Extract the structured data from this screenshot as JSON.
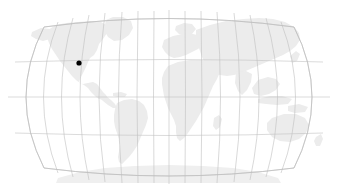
{
  "map": {
    "title": "World Map",
    "projection": "robinson",
    "background_color": "#ffffff",
    "land_color": "#ececec",
    "graticule_color": "#bfbfbf",
    "outline_color": "#bdbdbd",
    "marker_color": "#000000",
    "viewport": {
      "width": 337,
      "height": 196
    },
    "graticule": {
      "visible": true,
      "meridian_interval_degrees": 20,
      "parallel_interval_degrees": 30,
      "central_meridian_longitude": 0,
      "parallels_degrees": [
        60,
        30,
        0,
        -30,
        -60
      ],
      "meridians_degrees": [
        -180,
        -160,
        -140,
        -120,
        -100,
        -80,
        -60,
        -40,
        -20,
        0,
        20,
        40,
        60,
        80,
        100,
        120,
        140,
        160,
        180
      ]
    },
    "extent": {
      "left_px": 8,
      "right_px": 330,
      "top_px": 11,
      "bottom_px": 183,
      "equator_y_px": 97,
      "central_meridian_x_px": 169
    },
    "continents": [
      "North America",
      "South America",
      "Europe",
      "Africa",
      "Asia",
      "Australia",
      "Antarctica",
      "Greenland"
    ],
    "markers": [
      {
        "name": "location-marker",
        "label": "",
        "x_px": 79,
        "y_px": 63,
        "radius_px": 2.6,
        "color": "#000000",
        "region": "Western North America"
      }
    ]
  }
}
